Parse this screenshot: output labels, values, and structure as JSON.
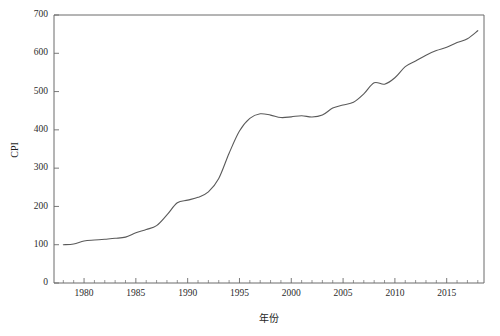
{
  "chart_data": {
    "type": "line",
    "title": "",
    "xlabel": "年份",
    "ylabel": "CPI",
    "xlim": [
      1977.1,
      2018.6
    ],
    "ylim": [
      0,
      700
    ],
    "grid": false,
    "legend": null,
    "x_ticks": [
      1980,
      1985,
      1990,
      1995,
      2000,
      2005,
      2010,
      2015
    ],
    "x_tick_labels": [
      "1980",
      "1985",
      "1990",
      "1995",
      "2000",
      "2005",
      "2010",
      "2015"
    ],
    "x_minor_tick_step": 1,
    "y_ticks": [
      0,
      100,
      200,
      300,
      400,
      500,
      600,
      700
    ],
    "y_tick_labels": [
      "0",
      "100",
      "200",
      "300",
      "400",
      "500",
      "600",
      "700"
    ],
    "line_color": "#5a5a5a",
    "series": [
      {
        "name": "CPI",
        "x": [
          1978,
          1979,
          1980,
          1981,
          1982,
          1983,
          1984,
          1985,
          1986,
          1987,
          1988,
          1989,
          1990,
          1991,
          1992,
          1993,
          1994,
          1995,
          1996,
          1997,
          1998,
          1999,
          2000,
          2001,
          2002,
          2003,
          2004,
          2005,
          2006,
          2007,
          2008,
          2009,
          2010,
          2011,
          2012,
          2013,
          2014,
          2015,
          2016,
          2017,
          2018
        ],
        "values": [
          100,
          101.9,
          109.5,
          112.2,
          114.4,
          116.7,
          119.9,
          131.1,
          139.6,
          149.8,
          177.9,
          209.5,
          216.4,
          223.8,
          238.1,
          273.1,
          339.0,
          396.9,
          429.9,
          441.9,
          438.4,
          432.2,
          434.0,
          437.0,
          433.5,
          438.7,
          456.8,
          465.0,
          472.0,
          494.0,
          523.0,
          519.3,
          536.1,
          565.0,
          579.7,
          595.0,
          607.0,
          615.5,
          628.0,
          638.0,
          659.0
        ]
      }
    ]
  },
  "axes": {
    "ylabel_text": "CPI",
    "xlabel_text": "年份"
  }
}
